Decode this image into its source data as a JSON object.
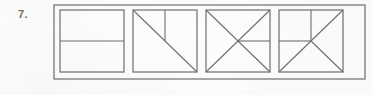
{
  "figure": {
    "problem_label": "7.",
    "caption": "",
    "background_color": "#fdfdfc",
    "stroke_color": "#6f6f6f",
    "outer_frame": {
      "name": "outer-frame",
      "x": 54,
      "y": 5,
      "width": 311,
      "height": 74
    },
    "squares": [
      {
        "name": "square-halves-horizontal",
        "index": 1,
        "x": 60,
        "y": 10,
        "size": 64,
        "division": "two-horizontal-halves",
        "parts": 2,
        "lines": [
          {
            "name": "mid-horizontal-line",
            "x1": 0,
            "y1": 32,
            "x2": 64,
            "y2": 32
          }
        ]
      },
      {
        "name": "square-diagonal-with-vertical",
        "index": 2,
        "x": 133,
        "y": 10,
        "size": 64,
        "division": "diagonal-plus-partial-vertical",
        "parts": 3,
        "lines": [
          {
            "name": "main-diagonal-line",
            "x1": 0,
            "y1": 0,
            "x2": 64,
            "y2": 64
          },
          {
            "name": "upper-vertical-line",
            "x1": 32,
            "y1": 0,
            "x2": 32,
            "y2": 32
          }
        ]
      },
      {
        "name": "square-both-diagonals-with-right-horizontal",
        "index": 3,
        "x": 206,
        "y": 10,
        "size": 64,
        "division": "both-diagonals-plus-right-half-horizontal",
        "parts": 5,
        "lines": [
          {
            "name": "diagonal-tl-br-line",
            "x1": 0,
            "y1": 0,
            "x2": 64,
            "y2": 64
          },
          {
            "name": "diagonal-bl-tr-line",
            "x1": 0,
            "y1": 64,
            "x2": 64,
            "y2": 0
          },
          {
            "name": "right-horizontal-line",
            "x1": 32,
            "y1": 32,
            "x2": 64,
            "y2": 32
          }
        ]
      },
      {
        "name": "square-quarter-cross-with-diagonals",
        "index": 4,
        "x": 279,
        "y": 10,
        "size": 64,
        "division": "upper-left-cross-plus-three-diagonals",
        "parts": 5,
        "lines": [
          {
            "name": "upper-vertical-line",
            "x1": 32,
            "y1": 0,
            "x2": 32,
            "y2": 32
          },
          {
            "name": "left-horizontal-line",
            "x1": 0,
            "y1": 32,
            "x2": 32,
            "y2": 32
          },
          {
            "name": "diagonal-center-to-top-right-line",
            "x1": 32,
            "y1": 32,
            "x2": 64,
            "y2": 0
          },
          {
            "name": "diagonal-center-to-bottom-right-line",
            "x1": 32,
            "y1": 32,
            "x2": 64,
            "y2": 64
          },
          {
            "name": "diagonal-center-to-bottom-left-line",
            "x1": 32,
            "y1": 32,
            "x2": 0,
            "y2": 64
          }
        ]
      }
    ]
  }
}
